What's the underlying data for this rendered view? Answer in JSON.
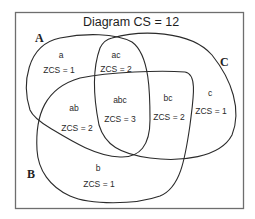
{
  "diagram": {
    "title": "Diagram CS = 12",
    "sets": [
      {
        "name": "A"
      },
      {
        "name": "B"
      },
      {
        "name": "C"
      }
    ],
    "regions": [
      {
        "id": "a",
        "label": "a",
        "value": "ZCS = 1"
      },
      {
        "id": "ac",
        "label": "ac",
        "value": "ZCS = 2"
      },
      {
        "id": "ab",
        "label": "ab",
        "value": "ZCS = 2"
      },
      {
        "id": "abc",
        "label": "abc",
        "value": "ZCS = 3"
      },
      {
        "id": "bc",
        "label": "bc",
        "value": "ZCS = 2"
      },
      {
        "id": "c",
        "label": "c",
        "value": "ZCS = 1"
      },
      {
        "id": "b",
        "label": "b",
        "value": "ZCS = 1"
      }
    ],
    "colors": {
      "stroke": "#2b2b2b",
      "frame": "#6e6e6e",
      "background": "#ffffff"
    }
  }
}
